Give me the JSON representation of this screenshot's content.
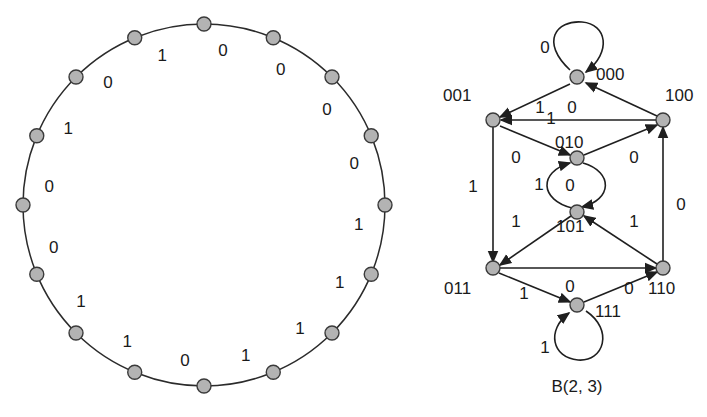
{
  "figure": {
    "caption": "B(2, 3)",
    "colors": {
      "node_fill": "#b3b3b3",
      "node_stroke": "#3a3a3a",
      "edge": "#1f1f1f",
      "background": "#ffffff",
      "text": "#1a1a1a"
    }
  },
  "cycle_diagram": {
    "name": "de-bruijn-cycle",
    "node_count": 16,
    "center": [
      204,
      205
    ],
    "radius": 181,
    "sequence": [
      "0",
      "0",
      "0",
      "0",
      "1",
      "1",
      "1",
      "1",
      "0",
      "1",
      "1",
      "0",
      "0",
      "1",
      "0",
      "1"
    ],
    "labels": [
      {
        "value": "0",
        "angle_deg": 0
      },
      {
        "value": "0",
        "angle_deg": 22.5
      },
      {
        "value": "0",
        "angle_deg": 45
      },
      {
        "value": "0",
        "angle_deg": 67.5
      },
      {
        "value": "1",
        "angle_deg": 90
      },
      {
        "value": "1",
        "angle_deg": 112.5
      },
      {
        "value": "1",
        "angle_deg": 135
      },
      {
        "value": "1",
        "angle_deg": 157.5
      },
      {
        "value": "0",
        "angle_deg": 180
      },
      {
        "value": "1",
        "angle_deg": 202.5
      },
      {
        "value": "1",
        "angle_deg": 225
      },
      {
        "value": "0",
        "angle_deg": 247.5
      },
      {
        "value": "0",
        "angle_deg": 270
      },
      {
        "value": "1",
        "angle_deg": 292.5
      },
      {
        "value": "0",
        "angle_deg": 315
      },
      {
        "value": "1",
        "angle_deg": 337.5
      }
    ]
  },
  "graph_diagram": {
    "name": "de-bruijn-graph",
    "nodes": [
      {
        "id": "000",
        "label": "000",
        "x": 577,
        "y": 77,
        "label_x": 596,
        "label_y": 80,
        "anchor": "start"
      },
      {
        "id": "001",
        "label": "001",
        "x": 493,
        "y": 120,
        "label_x": 443,
        "label_y": 101,
        "anchor": "start"
      },
      {
        "id": "100",
        "label": "100",
        "x": 663,
        "y": 120,
        "label_x": 665,
        "label_y": 101,
        "anchor": "start"
      },
      {
        "id": "010",
        "label": "010",
        "x": 577,
        "y": 158,
        "label_x": 555,
        "label_y": 148,
        "anchor": "start"
      },
      {
        "id": "101",
        "label": "101",
        "x": 577,
        "y": 212,
        "label_x": 556,
        "label_y": 232,
        "anchor": "start"
      },
      {
        "id": "011",
        "label": "011",
        "x": 493,
        "y": 268,
        "label_x": 444,
        "label_y": 294,
        "anchor": "start"
      },
      {
        "id": "110",
        "label": "110",
        "x": 663,
        "y": 268,
        "label_x": 648,
        "label_y": 294,
        "anchor": "start"
      },
      {
        "id": "111",
        "label": "111",
        "x": 577,
        "y": 305,
        "label_x": 595,
        "label_y": 317,
        "anchor": "start"
      }
    ],
    "edge_labels": [
      {
        "value": "0",
        "x": 545,
        "y": 53
      },
      {
        "value": "1",
        "x": 540,
        "y": 113
      },
      {
        "value": "1",
        "x": 551,
        "y": 124
      },
      {
        "value": "0",
        "x": 572,
        "y": 113
      },
      {
        "value": "0",
        "x": 516,
        "y": 163
      },
      {
        "value": "0",
        "x": 634,
        "y": 163
      },
      {
        "value": "1",
        "x": 473,
        "y": 192
      },
      {
        "value": "1",
        "x": 539,
        "y": 190
      },
      {
        "value": "0",
        "x": 570,
        "y": 191
      },
      {
        "value": "0",
        "x": 681,
        "y": 210
      },
      {
        "value": "1",
        "x": 516,
        "y": 227
      },
      {
        "value": "1",
        "x": 634,
        "y": 227
      },
      {
        "value": "0",
        "x": 570,
        "y": 292
      },
      {
        "value": "1",
        "x": 524,
        "y": 299
      },
      {
        "value": "0",
        "x": 629,
        "y": 294
      },
      {
        "value": "1",
        "x": 545,
        "y": 353
      }
    ]
  }
}
